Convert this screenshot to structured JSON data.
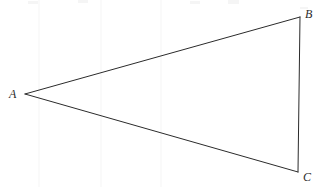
{
  "figure": {
    "background_color": "#ffffff",
    "stroke_color": "#2b2b2b",
    "stroke_width": 1,
    "width": 319,
    "height": 187,
    "labels": {
      "a": "A",
      "b": "B",
      "c": "C"
    },
    "vertices": [
      {
        "name": "A",
        "x": 25,
        "y": 94
      },
      {
        "name": "B",
        "x": 300,
        "y": 17
      },
      {
        "name": "C",
        "x": 298,
        "y": 172
      }
    ],
    "edges": [
      {
        "name": "AB",
        "from": "A",
        "to": "B"
      },
      {
        "name": "BC",
        "from": "B",
        "to": "C"
      },
      {
        "name": "CA",
        "from": "C",
        "to": "A"
      }
    ],
    "label_offsets": {
      "a": {
        "x": 9,
        "y": 88
      },
      "b": {
        "x": 305,
        "y": 8
      },
      "c": {
        "x": 303,
        "y": 171
      }
    },
    "artifacts": [
      {
        "name": "scan-speck-1",
        "x": 28,
        "y": 1,
        "width": 10,
        "height": 3
      },
      {
        "name": "scan-speck-2",
        "x": 78,
        "y": 0,
        "width": 10,
        "height": 3
      },
      {
        "name": "scan-speck-3",
        "x": 190,
        "y": 1,
        "width": 10,
        "height": 3
      },
      {
        "name": "scan-speck-4",
        "x": 228,
        "y": 0,
        "width": 11,
        "height": 4
      },
      {
        "name": "scan-speck-5",
        "x": 300,
        "y": 7,
        "width": 8,
        "height": 2
      }
    ],
    "scan_bands": [
      {
        "name": "scan-band-left",
        "x": 38,
        "y": 0,
        "width": 2,
        "height": 187
      },
      {
        "name": "scan-band-mid",
        "x": 100,
        "y": 0,
        "width": 2,
        "height": 187
      },
      {
        "name": "scan-band-right",
        "x": 160,
        "y": 0,
        "width": 2,
        "height": 187
      }
    ]
  }
}
